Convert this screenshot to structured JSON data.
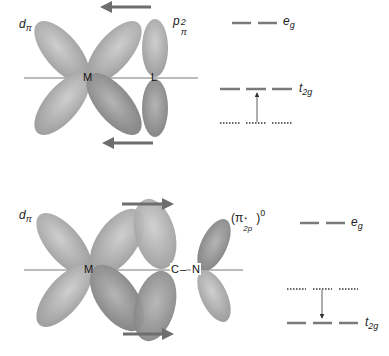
{
  "panels": [
    {
      "name": "pi-donation",
      "metal_orbital_label": "d",
      "metal_orbital_sub": "π",
      "ligand_orbital_label": "p",
      "ligand_orbital_sub": "π",
      "ligand_orbital_sup": "2",
      "atoms": [
        "M",
        "L"
      ],
      "arrow_direction": "left",
      "energy_levels": {
        "upper_label": "e",
        "upper_sub": "g",
        "middle_label": "t",
        "middle_sub": "2g",
        "ligand_level": "dotted, below t2g",
        "transition": "ligand level raises t2g (arrow up)"
      }
    },
    {
      "name": "pi-backbonding",
      "metal_orbital_label": "d",
      "metal_orbital_sub": "π",
      "ligand_orbital_label": "(π",
      "ligand_orbital_sub": "2p",
      "ligand_orbital_star": "*",
      "ligand_orbital_sup": "0",
      "atoms": [
        "M",
        "C",
        "N"
      ],
      "bond_dash": "–",
      "arrow_direction": "right",
      "energy_levels": {
        "upper_label": "e",
        "upper_sub": "g",
        "lower_label": "t",
        "lower_sub": "2g",
        "ligand_level": "dotted, above t2g",
        "transition": "ligand level lowers t2g (arrow down)"
      }
    }
  ],
  "colors": {
    "lobe_fill": "#a8a8a8",
    "lobe_dark": "#8c8c8c",
    "arrow": "#6e6e6e",
    "axis": "#555555",
    "level": "#7a7a7a"
  }
}
